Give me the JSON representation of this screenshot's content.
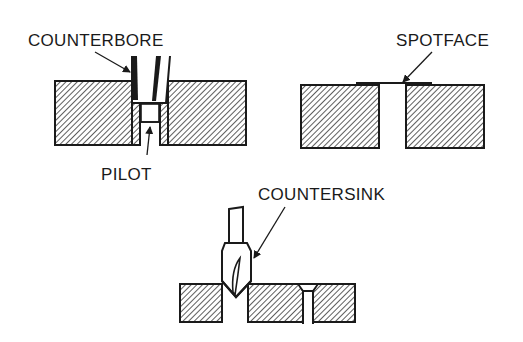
{
  "labels": {
    "counterbore": "COUNTERBORE",
    "pilot": "PILOT",
    "spotface": "SPOTFACE",
    "countersink": "COUNTERSINK"
  },
  "colors": {
    "ink": "#1a1a1a",
    "paper": "#ffffff"
  }
}
